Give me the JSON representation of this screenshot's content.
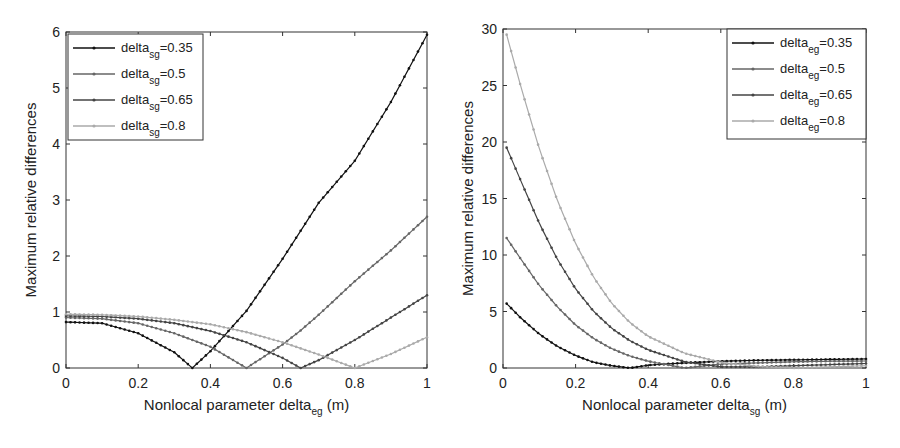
{
  "chart_data": [
    {
      "type": "line",
      "xlabel": "Nonlocal parameter delta_eg (m)",
      "xlabel_main": "Nonlocal parameter delta",
      "xlabel_sub": "eg",
      "xlabel_unit": " (m)",
      "ylabel": "Maximum relative differences",
      "xlim": [
        0,
        1
      ],
      "ylim": [
        0,
        6
      ],
      "xticks": [
        "0",
        "0.2",
        "0.4",
        "0.6",
        "0.8",
        "1"
      ],
      "yticks": [
        "0",
        "1",
        "2",
        "3",
        "4",
        "5",
        "6"
      ],
      "legend_position": "upper left",
      "x": [
        0,
        0.1,
        0.2,
        0.3,
        0.35,
        0.4,
        0.5,
        0.6,
        0.65,
        0.7,
        0.8,
        0.9,
        1.0
      ],
      "series": [
        {
          "name": "delta_sg=0.35",
          "label_main": "delta",
          "label_sub": "sg",
          "label_val": "=0.35",
          "color": "#111111",
          "values": [
            0.82,
            0.8,
            0.62,
            0.28,
            0.0,
            0.3,
            1.02,
            1.95,
            2.45,
            2.95,
            3.7,
            4.75,
            5.95
          ]
        },
        {
          "name": "delta_sg=0.5",
          "label_main": "delta",
          "label_sub": "sg",
          "label_val": "=0.5",
          "color": "#666666",
          "values": [
            0.9,
            0.88,
            0.8,
            0.62,
            0.5,
            0.38,
            0.0,
            0.42,
            0.67,
            0.95,
            1.55,
            2.1,
            2.7
          ]
        },
        {
          "name": "delta_sg=0.65",
          "label_main": "delta",
          "label_sub": "sg",
          "label_val": "=0.65",
          "color": "#444444",
          "values": [
            0.93,
            0.92,
            0.88,
            0.8,
            0.73,
            0.66,
            0.46,
            0.18,
            0.0,
            0.14,
            0.5,
            0.9,
            1.3
          ]
        },
        {
          "name": "delta_sg=0.8",
          "label_main": "delta",
          "label_sub": "sg",
          "label_val": "=0.8",
          "color": "#aaaaaa",
          "values": [
            0.96,
            0.95,
            0.92,
            0.86,
            0.82,
            0.78,
            0.64,
            0.46,
            0.35,
            0.24,
            0.0,
            0.25,
            0.55
          ]
        }
      ]
    },
    {
      "type": "line",
      "xlabel": "Nonlocal parameter delta_sg (m)",
      "xlabel_main": "Nonlocal parameter delta",
      "xlabel_sub": "sg",
      "xlabel_unit": " (m)",
      "ylabel": "Maximum relative differences",
      "xlim": [
        0,
        1
      ],
      "ylim": [
        0,
        30
      ],
      "xticks": [
        "0",
        "0.2",
        "0.4",
        "0.6",
        "0.8",
        "1"
      ],
      "yticks": [
        "0",
        "5",
        "10",
        "15",
        "20",
        "25",
        "30"
      ],
      "legend_position": "upper right",
      "x": [
        0.01,
        0.05,
        0.1,
        0.15,
        0.2,
        0.25,
        0.3,
        0.35,
        0.4,
        0.5,
        0.6,
        0.7,
        0.8,
        0.9,
        1.0
      ],
      "series": [
        {
          "name": "delta_eg=0.35",
          "label_main": "delta",
          "label_sub": "eg",
          "label_val": "=0.35",
          "color": "#111111",
          "values": [
            5.7,
            4.4,
            3.0,
            1.9,
            1.1,
            0.5,
            0.2,
            0.0,
            0.25,
            0.45,
            0.6,
            0.68,
            0.72,
            0.76,
            0.8
          ]
        },
        {
          "name": "delta_eg=0.5",
          "label_main": "delta",
          "label_sub": "eg",
          "label_val": "=0.5",
          "color": "#666666",
          "values": [
            11.5,
            9.6,
            7.3,
            5.4,
            3.8,
            2.6,
            1.7,
            1.05,
            0.6,
            0.0,
            0.35,
            0.45,
            0.55,
            0.6,
            0.62
          ]
        },
        {
          "name": "delta_eg=0.65",
          "label_main": "delta",
          "label_sub": "eg",
          "label_val": "=0.65",
          "color": "#444444",
          "values": [
            19.5,
            16.5,
            12.8,
            9.6,
            7.0,
            5.0,
            3.5,
            2.4,
            1.6,
            0.55,
            0.1,
            0.1,
            0.2,
            0.3,
            0.4
          ]
        },
        {
          "name": "delta_eg=0.8",
          "label_main": "delta",
          "label_sub": "eg",
          "label_val": "=0.8",
          "color": "#aaaaaa",
          "values": [
            29.5,
            24.8,
            19.4,
            14.8,
            11.0,
            8.0,
            5.7,
            4.0,
            2.8,
            1.3,
            0.5,
            0.15,
            0.0,
            0.1,
            0.2
          ]
        }
      ]
    }
  ]
}
